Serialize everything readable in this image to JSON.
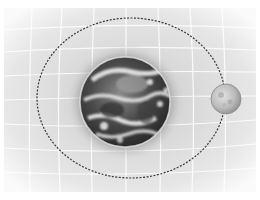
{
  "scene": {
    "description": "Grayscale illustration of Earth with the Moon on a dashed elliptical orbit over a warped grid background",
    "background_color": "#e6e6e6",
    "grid_color": "#ffffff",
    "orbit": {
      "cx": 131,
      "cy": 98,
      "rx": 94,
      "ry": 80,
      "stroke": "#3a3a3a",
      "style": "dashed"
    },
    "earth": {
      "label": "Earth",
      "cx": 125,
      "cy": 102,
      "r": 45
    },
    "moon": {
      "label": "Moon",
      "cx": 226,
      "cy": 99,
      "r": 15
    }
  }
}
